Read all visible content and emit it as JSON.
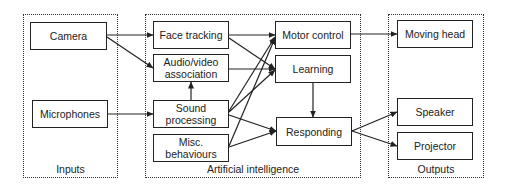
{
  "groups": [
    {
      "id": "inputs",
      "label": "Inputs",
      "x": 23,
      "y": 14,
      "w": 95,
      "h": 164
    },
    {
      "id": "ai",
      "label": "Artificial intelligence",
      "x": 145,
      "y": 14,
      "w": 216,
      "h": 164
    },
    {
      "id": "outputs",
      "label": "Outputs",
      "x": 388,
      "y": 14,
      "w": 96,
      "h": 164
    }
  ],
  "nodes": [
    {
      "id": "camera",
      "label": "Camera",
      "group": "inputs",
      "x": 30,
      "y": 22,
      "w": 77,
      "h": 28
    },
    {
      "id": "microphones",
      "label": "Microphones",
      "group": "inputs",
      "x": 32,
      "y": 100,
      "w": 76,
      "h": 28
    },
    {
      "id": "face_tracking",
      "label": "Face tracking",
      "group": "ai",
      "x": 153,
      "y": 21,
      "w": 76,
      "h": 28
    },
    {
      "id": "audio_video",
      "label": "Audio/video\nassociation",
      "group": "ai",
      "x": 153,
      "y": 54,
      "w": 76,
      "h": 28
    },
    {
      "id": "sound_processing",
      "label": "Sound\nprocessing",
      "group": "ai",
      "x": 153,
      "y": 100,
      "w": 76,
      "h": 28
    },
    {
      "id": "misc",
      "label": "Misc.\nbehaviours",
      "group": "ai",
      "x": 153,
      "y": 134,
      "w": 76,
      "h": 28
    },
    {
      "id": "motor_control",
      "label": "Motor control",
      "group": "ai",
      "x": 275,
      "y": 21,
      "w": 76,
      "h": 28
    },
    {
      "id": "learning",
      "label": "Learning",
      "group": "ai",
      "x": 275,
      "y": 55,
      "w": 76,
      "h": 28
    },
    {
      "id": "responding",
      "label": "Responding",
      "group": "ai",
      "x": 276,
      "y": 117,
      "w": 76,
      "h": 29
    },
    {
      "id": "moving_head",
      "label": "Moving head",
      "group": "outputs",
      "x": 397,
      "y": 20,
      "w": 76,
      "h": 28
    },
    {
      "id": "speaker",
      "label": "Speaker",
      "group": "outputs",
      "x": 397,
      "y": 98,
      "w": 76,
      "h": 28
    },
    {
      "id": "projector",
      "label": "Projector",
      "group": "outputs",
      "x": 397,
      "y": 132,
      "w": 76,
      "h": 28
    }
  ],
  "edges": [
    {
      "from": "camera",
      "to": "face_tracking",
      "x1": 107,
      "y1": 35,
      "x2": 153,
      "y2": 35
    },
    {
      "from": "camera",
      "to": "audio_video",
      "x1": 107,
      "y1": 37,
      "x2": 153,
      "y2": 68
    },
    {
      "from": "microphones",
      "to": "sound_processing",
      "x1": 108,
      "y1": 114,
      "x2": 153,
      "y2": 114
    },
    {
      "from": "sound_processing",
      "to": "audio_video",
      "x1": 191,
      "y1": 100,
      "x2": 191,
      "y2": 82
    },
    {
      "from": "face_tracking",
      "to": "motor_control",
      "x1": 229,
      "y1": 35,
      "x2": 275,
      "y2": 35
    },
    {
      "from": "face_tracking",
      "to": "learning",
      "x1": 229,
      "y1": 38,
      "x2": 275,
      "y2": 69
    },
    {
      "from": "audio_video",
      "to": "learning",
      "x1": 229,
      "y1": 69,
      "x2": 275,
      "y2": 69
    },
    {
      "from": "sound_processing",
      "to": "motor_control",
      "x1": 229,
      "y1": 111,
      "x2": 275,
      "y2": 37
    },
    {
      "from": "sound_processing",
      "to": "learning",
      "x1": 229,
      "y1": 112,
      "x2": 275,
      "y2": 70
    },
    {
      "from": "sound_processing",
      "to": "responding",
      "x1": 229,
      "y1": 115,
      "x2": 276,
      "y2": 131
    },
    {
      "from": "misc",
      "to": "motor_control",
      "x1": 229,
      "y1": 146,
      "x2": 275,
      "y2": 38
    },
    {
      "from": "misc",
      "to": "responding",
      "x1": 229,
      "y1": 147,
      "x2": 276,
      "y2": 131
    },
    {
      "from": "learning",
      "to": "responding",
      "x1": 313,
      "y1": 83,
      "x2": 313,
      "y2": 117
    },
    {
      "from": "motor_control",
      "to": "moving_head",
      "x1": 351,
      "y1": 34,
      "x2": 397,
      "y2": 34
    },
    {
      "from": "responding",
      "to": "speaker",
      "x1": 352,
      "y1": 131,
      "x2": 397,
      "y2": 112
    },
    {
      "from": "responding",
      "to": "projector",
      "x1": 352,
      "y1": 131,
      "x2": 397,
      "y2": 146
    }
  ],
  "colors": {
    "stroke": "#222222",
    "background": "#ffffff"
  }
}
